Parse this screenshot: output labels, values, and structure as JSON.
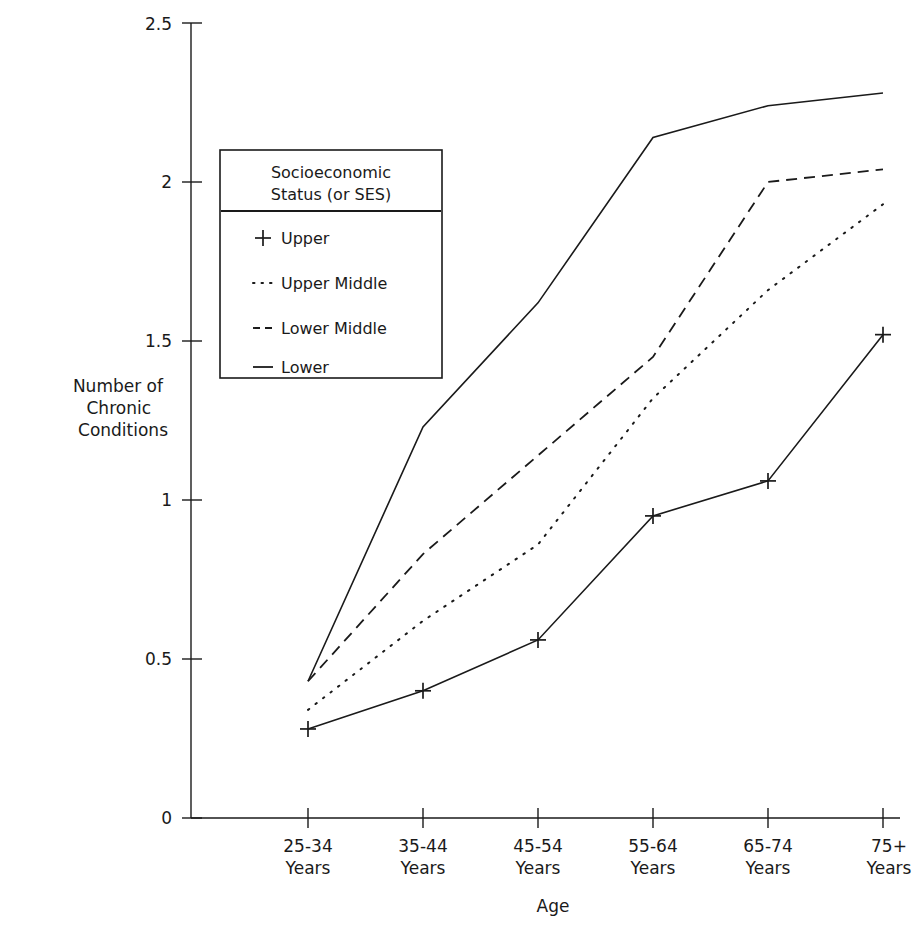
{
  "chart_data": {
    "type": "line",
    "title": "",
    "xlabel": "Age",
    "ylabel": "Number of\nChronic\nConditions",
    "ylabel_lines": [
      "Number of",
      "Chronic",
      "Conditions"
    ],
    "categories": [
      "25-34\nYears",
      "35-44\nYears",
      "45-54\nYears",
      "55-64\nYears",
      "65-74\nYears",
      "75+\nYears"
    ],
    "category_lines": [
      [
        "25-34",
        "Years"
      ],
      [
        "35-44",
        "Years"
      ],
      [
        "45-54",
        "Years"
      ],
      [
        "55-64",
        "Years"
      ],
      [
        "65-74",
        "Years"
      ],
      [
        "75+",
        "Years"
      ]
    ],
    "ylim": [
      0,
      2.5
    ],
    "yticks": [
      0,
      0.5,
      1,
      1.5,
      2,
      2.5
    ],
    "ytick_labels": [
      "0",
      "0.5",
      "1",
      "1.5",
      "2",
      "2.5"
    ],
    "grid": false,
    "legend_position": "upper-left-inside",
    "legend_title_lines": [
      "Socioeconomic",
      "Status (or SES)"
    ],
    "series": [
      {
        "name": "Upper",
        "style": "solid-plus",
        "marker": "plus",
        "values": [
          0.28,
          0.4,
          0.56,
          0.95,
          1.06,
          1.52
        ]
      },
      {
        "name": "Upper Middle",
        "style": "dotted",
        "marker": "none",
        "values": [
          0.34,
          0.62,
          0.86,
          1.32,
          1.66,
          1.93
        ]
      },
      {
        "name": "Lower Middle",
        "style": "dashed",
        "marker": "none",
        "values": [
          0.43,
          0.83,
          1.14,
          1.45,
          2.0,
          2.04
        ]
      },
      {
        "name": "Lower",
        "style": "solid",
        "marker": "none",
        "values": [
          0.43,
          1.23,
          1.62,
          2.14,
          2.24,
          2.28
        ]
      }
    ]
  },
  "legend": {
    "title_line1": "Socioeconomic",
    "title_line2": "Status (or SES)",
    "entries": [
      {
        "label": "Upper",
        "sample": "plus-marker"
      },
      {
        "label": "Upper Middle",
        "sample": "dotted-line"
      },
      {
        "label": "Lower Middle",
        "sample": "dashed-line"
      },
      {
        "label": "Lower",
        "sample": "solid-line"
      }
    ]
  },
  "axes": {
    "x_title": "Age",
    "y_title_line1": "Number of",
    "y_title_line2": "Chronic",
    "y_title_line3": "Conditions"
  },
  "colors": {
    "ink": "#1a1a1a",
    "background": "#ffffff"
  }
}
